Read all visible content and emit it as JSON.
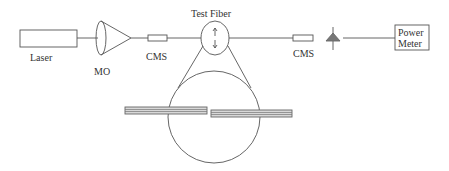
{
  "diagram": {
    "type": "optical-setup-schematic",
    "components": {
      "laser": {
        "label": "Laser"
      },
      "microscope_objective": {
        "label": "MO"
      },
      "cms_input": {
        "label": "CMS"
      },
      "test_fiber": {
        "label": "Test Fiber"
      },
      "cms_output": {
        "label": "CMS"
      },
      "photodetector": {
        "label": ""
      },
      "power_meter": {
        "label_line1": "Power",
        "label_line2": "Meter"
      }
    },
    "colors": {
      "line": "#555555",
      "detector_fill": "#777777",
      "plate_fill": "#cccccc"
    }
  }
}
